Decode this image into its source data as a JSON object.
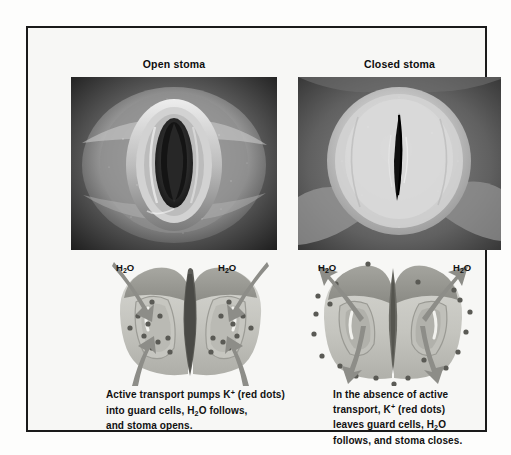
{
  "figure": {
    "panels": [
      {
        "id": "open",
        "heading": "Open stoma",
        "micrograph_alt": "scanning electron micrograph of an open stoma with two turgid guard cells forming an elongated pore",
        "water_label_left": "H2O",
        "water_label_right": "H2O",
        "caption_lines": [
          "Active transport pumps K+ (red dots)",
          "into guard cells, H2O follows,",
          "and stoma opens."
        ]
      },
      {
        "id": "closed",
        "heading": "Closed stoma",
        "micrograph_alt": "scanning electron micrograph of a closed stoma with flaccid guard cells and a narrow slit",
        "water_label_left": "H2O",
        "water_label_right": "H2O",
        "caption_lines": [
          "In the absence of active",
          "transport, K+ (red dots)",
          "leaves guard cells, H2O",
          "follows, and stoma closes."
        ]
      }
    ],
    "legend_terms": {
      "potassium_ion": "K+",
      "water": "H2O",
      "dot_meaning": "red dots"
    },
    "colors": {
      "frame_border": "#1a1a1a",
      "panel_background": "#f7f7f5",
      "page_background": "#ffffff",
      "text": "#111111",
      "potassium_dot": "#5a5a5a",
      "arrow": "#8d8d8d",
      "guard_cell_fill": "#c9c9c4",
      "guard_cell_inner": "#a9a9a3",
      "pore_dark": "#4e4e4e"
    }
  }
}
